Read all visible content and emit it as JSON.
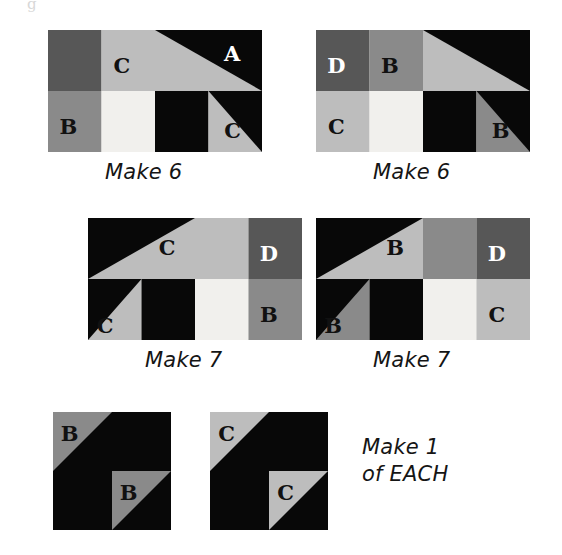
{
  "page": {
    "background": "#ffffff",
    "width": 562,
    "height": 555,
    "partial_glyph": "g"
  },
  "fabrics": {
    "A": {
      "label": "A",
      "color": "#080808",
      "name": "black"
    },
    "B": {
      "label": "B",
      "color": "#8a8a8a",
      "name": "medium-gray"
    },
    "C": {
      "label": "C",
      "color": "#bdbdbd",
      "name": "light-gray"
    },
    "D": {
      "label": "D",
      "color": "#575757",
      "name": "dark-gray"
    },
    "BG": {
      "label": "",
      "color": "#f1f0ed",
      "name": "off-white"
    }
  },
  "blocks": [
    {
      "id": "block-1",
      "caption": "Make 6",
      "quantity": 6,
      "x": 48,
      "y": 30,
      "w": 214,
      "h": 122,
      "cols": 4,
      "rows": 2,
      "caption_x": 105,
      "caption_y": 160,
      "units": [
        {
          "name": "unit-top-left-d",
          "kind": "square",
          "col": 0,
          "row": 0,
          "span": 1,
          "fill": "D",
          "letter": "",
          "letter_color": ""
        },
        {
          "name": "unit-top-c",
          "kind": "square",
          "col": 1,
          "row": 0,
          "span": 1,
          "fill": "C",
          "letter": "C",
          "letter_color": "#111111"
        },
        {
          "name": "unit-top-right-hst-a",
          "kind": "hst-tl-c",
          "col": 2,
          "row": 0,
          "span": 2,
          "fill": "A",
          "letter": "A",
          "letter_color": "#ffffff"
        },
        {
          "name": "unit-bottom-b",
          "kind": "square",
          "col": 0,
          "row": 1,
          "span": 1,
          "fill": "B",
          "letter": "B",
          "letter_color": "#111111"
        },
        {
          "name": "unit-bottom-bg",
          "kind": "square",
          "col": 1,
          "row": 1,
          "span": 1,
          "fill": "BG",
          "letter": "",
          "letter_color": ""
        },
        {
          "name": "unit-bottom-black",
          "kind": "square",
          "col": 2,
          "row": 1,
          "span": 1,
          "fill": "A",
          "letter": "",
          "letter_color": ""
        },
        {
          "name": "unit-bottom-right-c",
          "kind": "corner-c",
          "col": 3,
          "row": 1,
          "span": 1,
          "fill": "C",
          "letter": "C",
          "letter_color": "#111111"
        }
      ]
    },
    {
      "id": "block-2",
      "caption": "Make 6",
      "quantity": 6,
      "x": 316,
      "y": 30,
      "w": 214,
      "h": 122,
      "cols": 4,
      "rows": 2,
      "caption_x": 373,
      "caption_y": 160,
      "units": [
        {
          "name": "unit-top-left-d",
          "kind": "square",
          "col": 0,
          "row": 0,
          "span": 1,
          "fill": "D",
          "letter": "D",
          "letter_color": "#ffffff"
        },
        {
          "name": "unit-top-b",
          "kind": "square",
          "col": 1,
          "row": 0,
          "span": 1,
          "fill": "B",
          "letter": "B",
          "letter_color": "#111111"
        },
        {
          "name": "unit-top-right-hst-a",
          "kind": "hst-tl-c",
          "col": 2,
          "row": 0,
          "span": 2,
          "fill": "A",
          "letter": "",
          "letter_color": ""
        },
        {
          "name": "unit-bottom-c",
          "kind": "square",
          "col": 0,
          "row": 1,
          "span": 1,
          "fill": "C",
          "letter": "C",
          "letter_color": "#111111"
        },
        {
          "name": "unit-bottom-bg",
          "kind": "square",
          "col": 1,
          "row": 1,
          "span": 1,
          "fill": "BG",
          "letter": "",
          "letter_color": ""
        },
        {
          "name": "unit-bottom-black",
          "kind": "square",
          "col": 2,
          "row": 1,
          "span": 1,
          "fill": "A",
          "letter": "",
          "letter_color": ""
        },
        {
          "name": "unit-bottom-right-b",
          "kind": "corner-c",
          "col": 3,
          "row": 1,
          "span": 1,
          "fill": "B",
          "letter": "B",
          "letter_color": "#111111"
        }
      ]
    },
    {
      "id": "block-3",
      "caption": "Make 7",
      "quantity": 7,
      "x": 88,
      "y": 218,
      "w": 214,
      "h": 122,
      "cols": 4,
      "rows": 2,
      "caption_x": 145,
      "caption_y": 348,
      "units": [
        {
          "name": "unit-top-left-hst-a",
          "kind": "hst-tr-c",
          "col": 0,
          "row": 0,
          "span": 2,
          "fill": "A",
          "letter": "C",
          "letter_color": "#111111"
        },
        {
          "name": "unit-top-c",
          "kind": "square",
          "col": 2,
          "row": 0,
          "span": 1,
          "fill": "C",
          "letter": "",
          "letter_color": ""
        },
        {
          "name": "unit-top-right-d",
          "kind": "square",
          "col": 3,
          "row": 0,
          "span": 1,
          "fill": "D",
          "letter": "D",
          "letter_color": "#ffffff"
        },
        {
          "name": "unit-bottom-left-c",
          "kind": "corner-a",
          "col": 0,
          "row": 1,
          "span": 1,
          "fill": "C",
          "letter": "C",
          "letter_color": "#111111"
        },
        {
          "name": "unit-bottom-black",
          "kind": "square",
          "col": 1,
          "row": 1,
          "span": 1,
          "fill": "A",
          "letter": "",
          "letter_color": ""
        },
        {
          "name": "unit-bottom-bg",
          "kind": "square",
          "col": 2,
          "row": 1,
          "span": 1,
          "fill": "BG",
          "letter": "",
          "letter_color": ""
        },
        {
          "name": "unit-bottom-right-b",
          "kind": "square",
          "col": 3,
          "row": 1,
          "span": 1,
          "fill": "B",
          "letter": "B",
          "letter_color": "#111111"
        }
      ]
    },
    {
      "id": "block-4",
      "caption": "Make 7",
      "quantity": 7,
      "x": 316,
      "y": 218,
      "w": 214,
      "h": 122,
      "cols": 4,
      "rows": 2,
      "caption_x": 373,
      "caption_y": 348,
      "units": [
        {
          "name": "unit-top-left-hst-a",
          "kind": "hst-tr-c",
          "col": 0,
          "row": 0,
          "span": 2,
          "fill": "A",
          "letter": "B",
          "letter_color": "#111111"
        },
        {
          "name": "unit-top-b",
          "kind": "square",
          "col": 2,
          "row": 0,
          "span": 1,
          "fill": "B",
          "letter": "",
          "letter_color": ""
        },
        {
          "name": "unit-top-right-d",
          "kind": "square",
          "col": 3,
          "row": 0,
          "span": 1,
          "fill": "D",
          "letter": "D",
          "letter_color": "#ffffff"
        },
        {
          "name": "unit-bottom-left-b",
          "kind": "corner-a",
          "col": 0,
          "row": 1,
          "span": 1,
          "fill": "B",
          "letter": "B",
          "letter_color": "#111111"
        },
        {
          "name": "unit-bottom-black",
          "kind": "square",
          "col": 1,
          "row": 1,
          "span": 1,
          "fill": "A",
          "letter": "",
          "letter_color": ""
        },
        {
          "name": "unit-bottom-bg",
          "kind": "square",
          "col": 2,
          "row": 1,
          "span": 1,
          "fill": "BG",
          "letter": "",
          "letter_color": ""
        },
        {
          "name": "unit-bottom-right-c",
          "kind": "square",
          "col": 3,
          "row": 1,
          "span": 1,
          "fill": "C",
          "letter": "C",
          "letter_color": "#111111"
        }
      ]
    },
    {
      "id": "block-5",
      "caption": "",
      "quantity": 1,
      "x": 53,
      "y": 412,
      "w": 118,
      "h": 118,
      "cols": 2,
      "rows": 2,
      "caption_x": 0,
      "caption_y": 0,
      "units": [
        {
          "name": "unit-top-left-hst",
          "kind": "hst-tl-fill",
          "col": 0,
          "row": 0,
          "span": 1,
          "fill": "B",
          "letter": "B",
          "letter_color": "#111111"
        },
        {
          "name": "unit-top-right-black",
          "kind": "square",
          "col": 1,
          "row": 0,
          "span": 1,
          "fill": "A",
          "letter": "",
          "letter_color": ""
        },
        {
          "name": "unit-bottom-left-black",
          "kind": "square",
          "col": 0,
          "row": 1,
          "span": 1,
          "fill": "A",
          "letter": "",
          "letter_color": ""
        },
        {
          "name": "unit-bottom-right-hst",
          "kind": "hst-tl-fill",
          "col": 1,
          "row": 1,
          "span": 1,
          "fill": "B",
          "letter": "B",
          "letter_color": "#111111"
        }
      ]
    },
    {
      "id": "block-6",
      "caption": "",
      "quantity": 1,
      "x": 210,
      "y": 412,
      "w": 118,
      "h": 118,
      "cols": 2,
      "rows": 2,
      "caption_x": 0,
      "caption_y": 0,
      "units": [
        {
          "name": "unit-top-left-hst",
          "kind": "hst-tl-fill",
          "col": 0,
          "row": 0,
          "span": 1,
          "fill": "C",
          "letter": "C",
          "letter_color": "#111111"
        },
        {
          "name": "unit-top-right-black",
          "kind": "square",
          "col": 1,
          "row": 0,
          "span": 1,
          "fill": "A",
          "letter": "",
          "letter_color": ""
        },
        {
          "name": "unit-bottom-left-black",
          "kind": "square",
          "col": 0,
          "row": 1,
          "span": 1,
          "fill": "A",
          "letter": "",
          "letter_color": ""
        },
        {
          "name": "unit-bottom-right-hst",
          "kind": "hst-tl-fill",
          "col": 1,
          "row": 1,
          "span": 1,
          "fill": "C",
          "letter": "C",
          "letter_color": "#111111"
        }
      ]
    }
  ],
  "notes": [
    {
      "id": "note-make-1-each",
      "lines": [
        "Make 1",
        "of EACH"
      ],
      "x": 362,
      "y": 434
    }
  ]
}
